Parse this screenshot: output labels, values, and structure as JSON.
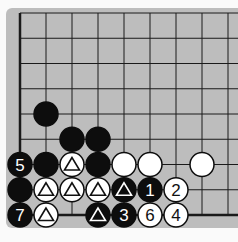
{
  "diagram": {
    "type": "go-board-fragment",
    "colors": {
      "board": "#bdbdbd",
      "line": "#1a1a1a",
      "black": "#0d0d0d",
      "white": "#ffffff"
    },
    "grid": {
      "x0": 20,
      "dx": 26,
      "y0": 13,
      "dy": 25.25,
      "cols": 9,
      "rows": 9
    },
    "stones": [
      {
        "color": "black",
        "col": 1,
        "row": 4,
        "label": ""
      },
      {
        "color": "black",
        "col": 2,
        "row": 5,
        "label": ""
      },
      {
        "color": "black",
        "col": 3,
        "row": 5,
        "label": ""
      },
      {
        "color": "black",
        "col": 0,
        "row": 6,
        "label": "5"
      },
      {
        "color": "black",
        "col": 1,
        "row": 6,
        "label": ""
      },
      {
        "color": "white",
        "col": 2,
        "row": 6,
        "label": "triangle"
      },
      {
        "color": "black",
        "col": 3,
        "row": 6,
        "label": ""
      },
      {
        "color": "white",
        "col": 4,
        "row": 6,
        "label": ""
      },
      {
        "color": "white",
        "col": 5,
        "row": 6,
        "label": ""
      },
      {
        "color": "white",
        "col": 7,
        "row": 6,
        "label": ""
      },
      {
        "color": "black",
        "col": 0,
        "row": 7,
        "label": ""
      },
      {
        "color": "white",
        "col": 1,
        "row": 7,
        "label": "triangle"
      },
      {
        "color": "white",
        "col": 2,
        "row": 7,
        "label": "triangle"
      },
      {
        "color": "white",
        "col": 3,
        "row": 7,
        "label": "triangle"
      },
      {
        "color": "black",
        "col": 4,
        "row": 7,
        "label": "triangle"
      },
      {
        "color": "black",
        "col": 5,
        "row": 7,
        "label": "1"
      },
      {
        "color": "white",
        "col": 6,
        "row": 7,
        "label": "2"
      },
      {
        "color": "black",
        "col": 0,
        "row": 8,
        "label": "7"
      },
      {
        "color": "white",
        "col": 1,
        "row": 8,
        "label": "triangle"
      },
      {
        "color": "black",
        "col": 3,
        "row": 8,
        "label": "triangle"
      },
      {
        "color": "black",
        "col": 4,
        "row": 8,
        "label": "3"
      },
      {
        "color": "white",
        "col": 5,
        "row": 8,
        "label": "6"
      },
      {
        "color": "white",
        "col": 6,
        "row": 8,
        "label": "4"
      }
    ]
  }
}
